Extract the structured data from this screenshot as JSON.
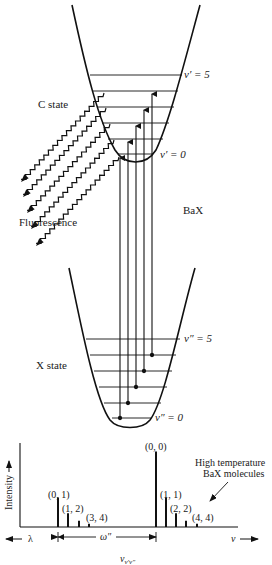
{
  "diagram": {
    "molecule_label": "BaX",
    "upper_state": {
      "name": "C state",
      "top_level_label": "v′ = 5",
      "bottom_level_label": "v′ = 0",
      "levels": 6
    },
    "lower_state": {
      "name": "X state",
      "top_level_label": "v″ = 5",
      "bottom_level_label": "v″ = 0",
      "levels": 6
    },
    "fluorescence_label": "Fluorescence",
    "absorption_transitions": [
      "(0,1)",
      "(1,2)",
      "(2,3)",
      "(3,4)",
      "(4,5)"
    ]
  },
  "chart_data": {
    "type": "bar",
    "title": "",
    "xlabel": "ν",
    "ylabel": "Intensity",
    "x_left_label": "λ",
    "x_right_label": "ν",
    "bottom_label": "νv′v″",
    "spacing_label": "ω″",
    "annotation": "High temperature BaX molecules",
    "categories": [
      "(0, 1)",
      "(1, 2)",
      "(2, 3)",
      "(3, 4)",
      "(0, 0)",
      "(1, 1)",
      "(2, 2)",
      "(3, 3)",
      "(4, 4)"
    ],
    "labeled": [
      "(0, 1)",
      "(1, 2)",
      "(3, 4)",
      "(0, 0)",
      "(1, 1)",
      "(2, 2)",
      "(4, 4)"
    ],
    "x": [
      58,
      68,
      79,
      89,
      156,
      166,
      176,
      186,
      197
    ],
    "values": [
      28,
      13,
      6,
      3,
      72,
      28,
      13,
      6,
      3
    ],
    "ylim": [
      0,
      80
    ],
    "grid": false
  },
  "text": {
    "v_prime_5": "v′ = 5",
    "v_prime_0": "v′ = 0",
    "c_state": "C state",
    "fluorescence": "Fluorescence",
    "bax": "BaX",
    "v_dprime_5": "v″ = 5",
    "v_dprime_0": "v″ = 0",
    "x_state": "X state",
    "intensity": "Intensity",
    "lambda": "λ",
    "nu": "ν",
    "omega": "ω″",
    "nu_sub_main": "ν",
    "nu_sub": "v′v″",
    "ht_line1": "High temperature",
    "ht_line2": "BaX molecules",
    "p01": "(0, 1)",
    "p12": "(1, 2)",
    "p34": "(3, 4)",
    "p00": "(0, 0)",
    "p11": "(1, 1)",
    "p22": "(2, 2)",
    "p44": "(4, 4)"
  }
}
